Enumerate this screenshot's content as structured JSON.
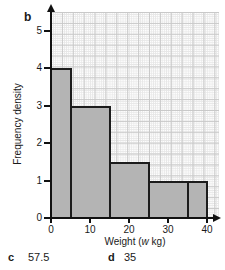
{
  "page": {
    "part_label": "b"
  },
  "chart_data": {
    "type": "bar",
    "subtype": "histogram",
    "title": "",
    "xlabel": "Weight (w kg)",
    "xlabel_parts": {
      "prefix": "Weight (",
      "var": "w",
      "suffix": " kg)"
    },
    "ylabel": "Frequency density",
    "x_ticks": [
      0,
      10,
      20,
      30,
      40
    ],
    "y_ticks": [
      0,
      1,
      2,
      3,
      4,
      5
    ],
    "xlim": [
      0,
      42
    ],
    "ylim": [
      0,
      5.5
    ],
    "grid": "fine graph paper",
    "legend": "none",
    "bars": [
      {
        "from": 0,
        "to": 5,
        "frequency_density": 4
      },
      {
        "from": 5,
        "to": 15,
        "frequency_density": 3
      },
      {
        "from": 15,
        "to": 25,
        "frequency_density": 1.5
      },
      {
        "from": 25,
        "to": 35,
        "frequency_density": 1
      },
      {
        "from": 35,
        "to": 40,
        "frequency_density": 1
      }
    ],
    "colors": {
      "bar_fill": "#b4b4b4",
      "bar_border": "#1c1c1c",
      "axis": "#111111",
      "grid_minor": "#e7e7e7",
      "grid_major": "#c9c9c9"
    }
  },
  "answers": {
    "c": {
      "label": "c",
      "value": "57.5"
    },
    "d": {
      "label": "d",
      "value": "35"
    }
  }
}
